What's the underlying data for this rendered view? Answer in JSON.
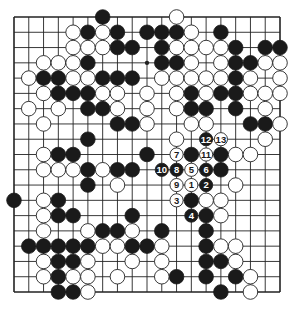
{
  "diagram": {
    "type": "go-board",
    "size": 19,
    "colors": {
      "line": "#222222",
      "black": "#1a1a1a",
      "white": "#ffffff",
      "background": "#ffffff"
    },
    "star_points": [
      [
        3,
        3
      ],
      [
        3,
        9
      ],
      [
        3,
        15
      ],
      [
        9,
        3
      ],
      [
        9,
        9
      ],
      [
        9,
        15
      ],
      [
        15,
        3
      ],
      [
        15,
        9
      ],
      [
        15,
        15
      ]
    ],
    "stones": {
      "black": [
        [
          0,
          6
        ],
        [
          1,
          5
        ],
        [
          1,
          7
        ],
        [
          1,
          9
        ],
        [
          1,
          10
        ],
        [
          1,
          11
        ],
        [
          1,
          14
        ],
        [
          2,
          7
        ],
        [
          2,
          8
        ],
        [
          2,
          10
        ],
        [
          2,
          15
        ],
        [
          2,
          17
        ],
        [
          2,
          18
        ],
        [
          3,
          5
        ],
        [
          3,
          10
        ],
        [
          3,
          11
        ],
        [
          3,
          15
        ],
        [
          3,
          16
        ],
        [
          4,
          2
        ],
        [
          4,
          3
        ],
        [
          4,
          6
        ],
        [
          4,
          7
        ],
        [
          4,
          8
        ],
        [
          4,
          15
        ],
        [
          5,
          3
        ],
        [
          5,
          4
        ],
        [
          5,
          5
        ],
        [
          5,
          12
        ],
        [
          5,
          14
        ],
        [
          5,
          15
        ],
        [
          6,
          5
        ],
        [
          6,
          6
        ],
        [
          6,
          12
        ],
        [
          6,
          13
        ],
        [
          6,
          15
        ],
        [
          7,
          7
        ],
        [
          7,
          8
        ],
        [
          7,
          16
        ],
        [
          7,
          17
        ],
        [
          8,
          5
        ],
        [
          9,
          3
        ],
        [
          9,
          4
        ],
        [
          9,
          9
        ],
        [
          9,
          12
        ],
        [
          9,
          14
        ],
        [
          10,
          5
        ],
        [
          10,
          7
        ],
        [
          10,
          8
        ],
        [
          10,
          14
        ],
        [
          11,
          5
        ],
        [
          12,
          0
        ],
        [
          12,
          3
        ],
        [
          12,
          12
        ],
        [
          13,
          3
        ],
        [
          13,
          4
        ],
        [
          13,
          8
        ],
        [
          13,
          13
        ],
        [
          14,
          6
        ],
        [
          14,
          7
        ],
        [
          14,
          10
        ],
        [
          14,
          13
        ],
        [
          15,
          1
        ],
        [
          15,
          2
        ],
        [
          15,
          3
        ],
        [
          15,
          4
        ],
        [
          15,
          5
        ],
        [
          15,
          8
        ],
        [
          15,
          9
        ],
        [
          15,
          13
        ],
        [
          16,
          3
        ],
        [
          16,
          4
        ],
        [
          16,
          13
        ],
        [
          16,
          14
        ],
        [
          17,
          3
        ],
        [
          17,
          11
        ],
        [
          17,
          13
        ],
        [
          17,
          15
        ],
        [
          18,
          3
        ],
        [
          18,
          4
        ],
        [
          18,
          14
        ]
      ],
      "white": [
        [
          0,
          11
        ],
        [
          1,
          4
        ],
        [
          1,
          6
        ],
        [
          1,
          12
        ],
        [
          2,
          4
        ],
        [
          2,
          5
        ],
        [
          2,
          6
        ],
        [
          2,
          11
        ],
        [
          2,
          12
        ],
        [
          2,
          13
        ],
        [
          2,
          14
        ],
        [
          3,
          2
        ],
        [
          3,
          3
        ],
        [
          3,
          4
        ],
        [
          3,
          12
        ],
        [
          3,
          14
        ],
        [
          3,
          17
        ],
        [
          3,
          18
        ],
        [
          4,
          1
        ],
        [
          4,
          4
        ],
        [
          4,
          5
        ],
        [
          4,
          10
        ],
        [
          4,
          11
        ],
        [
          4,
          12
        ],
        [
          4,
          13
        ],
        [
          4,
          14
        ],
        [
          4,
          16
        ],
        [
          4,
          18
        ],
        [
          5,
          2
        ],
        [
          5,
          6
        ],
        [
          5,
          7
        ],
        [
          5,
          9
        ],
        [
          5,
          11
        ],
        [
          5,
          13
        ],
        [
          5,
          16
        ],
        [
          5,
          17
        ],
        [
          5,
          18
        ],
        [
          6,
          1
        ],
        [
          6,
          3
        ],
        [
          6,
          7
        ],
        [
          6,
          9
        ],
        [
          6,
          11
        ],
        [
          6,
          17
        ],
        [
          7,
          2
        ],
        [
          7,
          9
        ],
        [
          7,
          12
        ],
        [
          7,
          13
        ],
        [
          7,
          18
        ],
        [
          8,
          11
        ],
        [
          8,
          17
        ],
        [
          9,
          2
        ],
        [
          9,
          15
        ],
        [
          9,
          16
        ],
        [
          10,
          2
        ],
        [
          10,
          3
        ],
        [
          10,
          4
        ],
        [
          10,
          6
        ],
        [
          11,
          7
        ],
        [
          11,
          15
        ],
        [
          12,
          2
        ],
        [
          12,
          13
        ],
        [
          12,
          14
        ],
        [
          13,
          2
        ],
        [
          13,
          14
        ],
        [
          14,
          2
        ],
        [
          14,
          5
        ],
        [
          14,
          8
        ],
        [
          15,
          6
        ],
        [
          15,
          7
        ],
        [
          15,
          10
        ],
        [
          15,
          14
        ],
        [
          15,
          15
        ],
        [
          16,
          2
        ],
        [
          16,
          5
        ],
        [
          16,
          8
        ],
        [
          16,
          10
        ],
        [
          16,
          15
        ],
        [
          17,
          2
        ],
        [
          17,
          4
        ],
        [
          17,
          5
        ],
        [
          17,
          7
        ],
        [
          17,
          10
        ],
        [
          17,
          16
        ],
        [
          18,
          5
        ],
        [
          18,
          16
        ]
      ]
    },
    "numbered_moves": [
      {
        "label": "1",
        "color": "white",
        "row": 11,
        "col": 12
      },
      {
        "label": "2",
        "color": "black",
        "row": 11,
        "col": 13
      },
      {
        "label": "3",
        "color": "white",
        "row": 12,
        "col": 11
      },
      {
        "label": "4",
        "color": "black",
        "row": 13,
        "col": 12
      },
      {
        "label": "5",
        "color": "white",
        "row": 10,
        "col": 12
      },
      {
        "label": "6",
        "color": "black",
        "row": 10,
        "col": 13
      },
      {
        "label": "7",
        "color": "white",
        "row": 9,
        "col": 11
      },
      {
        "label": "8",
        "color": "black",
        "row": 10,
        "col": 11
      },
      {
        "label": "9",
        "color": "white",
        "row": 11,
        "col": 11
      },
      {
        "label": "10",
        "color": "black",
        "row": 10,
        "col": 10
      },
      {
        "label": "11",
        "color": "white",
        "row": 9,
        "col": 13
      },
      {
        "label": "12",
        "color": "black",
        "row": 8,
        "col": 13
      },
      {
        "label": "13",
        "color": "white",
        "row": 8,
        "col": 14
      }
    ]
  }
}
